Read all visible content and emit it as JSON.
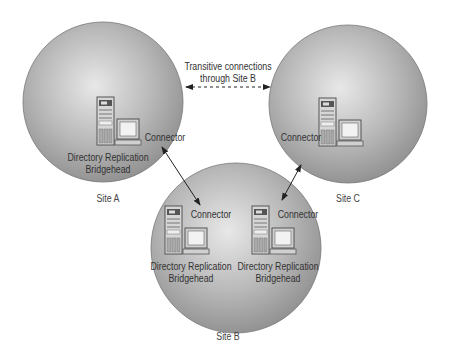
{
  "diagram": {
    "type": "site-replication-topology",
    "transitive_note": {
      "line1": "Transitive connections",
      "line2": "through Site B"
    },
    "sites": [
      {
        "id": "site-a",
        "label": "Site A",
        "servers": [
          {
            "role_line1": "Directory Replication",
            "role_line2": "Bridgehead",
            "connector_label": "Connector"
          }
        ]
      },
      {
        "id": "site-b",
        "label": "Site B",
        "servers": [
          {
            "role_line1": "Directory Replication",
            "role_line2": "Bridgehead",
            "connector_label": "Connector"
          },
          {
            "role_line1": "Directory Replication",
            "role_line2": "Bridgehead",
            "connector_label": "Connector"
          }
        ]
      },
      {
        "id": "site-c",
        "label": "Site C",
        "servers": [
          {
            "connector_label": "Connector"
          }
        ]
      }
    ],
    "links": [
      {
        "from": "site-a",
        "to": "site-b",
        "style": "solid",
        "arrows": "both"
      },
      {
        "from": "site-c",
        "to": "site-b",
        "style": "solid",
        "arrows": "both"
      },
      {
        "from": "site-a",
        "to": "site-c",
        "style": "dashed",
        "arrows": "both",
        "label": "Transitive connections through Site B"
      }
    ],
    "colors": {
      "sphere_light": "#e6e6e6",
      "sphere_dark": "#8a8a8a",
      "line": "#222222"
    }
  }
}
